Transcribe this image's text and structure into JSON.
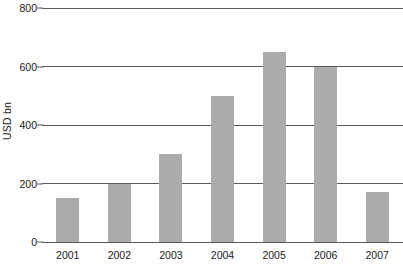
{
  "chart_data": {
    "type": "bar",
    "title": "",
    "subtitle": "",
    "xlabel": "",
    "ylabel": "USD bn",
    "categories": [
      "2001",
      "2002",
      "2003",
      "2004",
      "2005",
      "2006",
      "2007"
    ],
    "values": [
      150,
      200,
      300,
      500,
      650,
      600,
      170
    ],
    "series": [
      {
        "name": "USD bn",
        "values": [
          150,
          200,
          300,
          500,
          650,
          600,
          170
        ]
      }
    ],
    "ylim": [
      0,
      800
    ],
    "yticks": [
      0,
      200,
      400,
      600,
      800
    ],
    "ytick_labels": [
      "0",
      "200",
      "400",
      "600",
      "800"
    ],
    "grid": true,
    "grid_axis": "y",
    "legend": false,
    "legend_position": "none",
    "bar_color": "#ababab",
    "gridline_color": "#595959",
    "axis_color": "#595959",
    "text_color": "#1a1a1a",
    "background_color": "#ffffff"
  }
}
